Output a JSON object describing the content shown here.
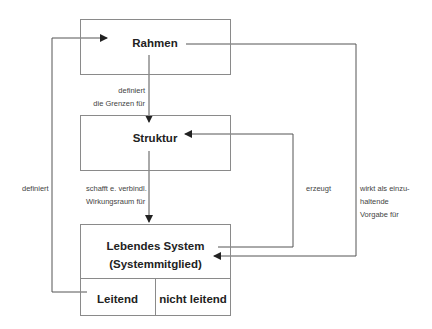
{
  "diagram": {
    "nodes": {
      "rahmen": "Rahmen",
      "struktur": "Struktur",
      "lebendes_system_line1": "Lebendes System",
      "lebendes_system_line2": "(Systemmitglied)",
      "leitend": "Leitend",
      "nicht_leitend": "nicht leitend"
    },
    "edge_labels": {
      "rahmen_to_struktur": [
        "definiert",
        "die Grenzen für"
      ],
      "struktur_to_system": [
        "schafft e. verbindl.",
        "Wirkungsraum für"
      ],
      "leitend_to_rahmen": "definiert",
      "system_to_struktur": "erzeugt",
      "rahmen_to_system": [
        "wirkt als einzu-",
        "haltende",
        "Vorgabe für"
      ]
    },
    "colors": {
      "line": "#555555",
      "box_border": "#8a8a8a",
      "text": "#222222",
      "label": "#444444"
    }
  }
}
